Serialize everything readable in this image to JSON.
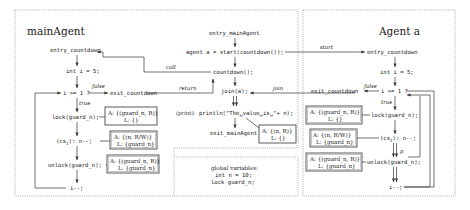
{
  "main_agent": {
    "title": "mainAgent",
    "nodes": {
      "entry": "entry_countdown",
      "init": "int i = 5;",
      "cond": "i >= 1 ?",
      "exit": "exit_countdown",
      "lock": "lock(guard_n);",
      "cs": "(cs",
      "cs_sub": "1",
      "cs_rest": "): n--;",
      "unlock": "unlock(guard_n);",
      "dec": "i--;"
    },
    "labels": {
      "false": "false",
      "true": "true"
    },
    "boxes": [
      {
        "a": "A: {(guard_n, R)}",
        "l": "L: {}"
      },
      {
        "a": "A: {(n, R/W)}",
        "l": "L: {guard_n}"
      },
      {
        "a": "A: {(guard_n, R)}",
        "l": "L: {guard_n}"
      }
    ]
  },
  "center": {
    "nodes": {
      "entry": "entry_mainAgent",
      "start": "agent a = start(countdown());",
      "call": "countdown();",
      "join": "join(a);",
      "print_label": "(print):",
      "print": "println(\"The␣value␣is␣\"+ n);",
      "exit": "exit_mainAgent"
    },
    "edge_labels": {
      "call": "call",
      "return": "return",
      "start": "start",
      "join": "join"
    },
    "box": {
      "a": "A: {(n, R)}",
      "l": "L: {}"
    }
  },
  "globals": {
    "title": "global variables:",
    "lines": [
      "int n = 10;",
      "lock guard_n;"
    ]
  },
  "agent_a": {
    "title": "Agent a",
    "nodes": {
      "entry": "entry_countdown",
      "init": "int i = 5;",
      "cond": "i >= 1 ?",
      "exit": "exit_countdown",
      "lock": "lock(guard_n);",
      "cs": "(cs",
      "cs_sub": "2",
      "cs_rest": "): n--;",
      "unlock": "unlock(guard_n);",
      "dec": "i--;"
    },
    "labels": {
      "false": "false",
      "true": "true",
      "p": "p"
    },
    "boxes": [
      {
        "a": "A: {(guard_n, R)}",
        "l": "L: {}"
      },
      {
        "a": "A: {(n, R/W)}",
        "l": "L: {guard_n}"
      },
      {
        "a": "A: {(guard_n, R)}",
        "l": "L: {guard_n}"
      }
    ]
  }
}
